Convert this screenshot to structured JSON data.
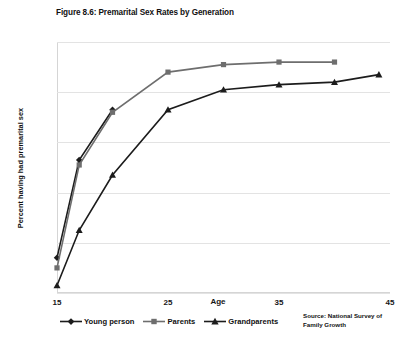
{
  "chart_data": {
    "type": "line",
    "title": "Figure 8.6: Premarital Sex Rates by Generation",
    "xlabel": "Age",
    "ylabel": "Percent having had premarital sex",
    "xlim": [
      15,
      45
    ],
    "ylim": [
      0,
      100
    ],
    "xticks": [
      "15",
      "25",
      "35",
      "45"
    ],
    "xtick_values": [
      15,
      25,
      35,
      45
    ],
    "yticks": [
      "0%",
      "20%",
      "40%",
      "60%",
      "80%",
      "100%"
    ],
    "ytick_values": [
      0,
      20,
      40,
      60,
      80,
      100
    ],
    "grid": "horizontal",
    "legend_position": "below-axis-left",
    "source": "Source: National Survey of Family Growth",
    "series": [
      {
        "name": "Young person",
        "marker": "diamond",
        "color": "#1c1c1c",
        "points": [
          {
            "x": 15,
            "y": 14
          },
          {
            "x": 17,
            "y": 53
          },
          {
            "x": 20,
            "y": 73
          }
        ]
      },
      {
        "name": "Parents",
        "marker": "square",
        "color": "#6e6e6e",
        "points": [
          {
            "x": 15,
            "y": 10
          },
          {
            "x": 17,
            "y": 51
          },
          {
            "x": 20,
            "y": 72
          },
          {
            "x": 25,
            "y": 88
          },
          {
            "x": 30,
            "y": 91
          },
          {
            "x": 35,
            "y": 92
          },
          {
            "x": 40,
            "y": 92
          }
        ]
      },
      {
        "name": "Grandparents",
        "marker": "triangle",
        "color": "#1c1c1c",
        "points": [
          {
            "x": 15,
            "y": 3
          },
          {
            "x": 17,
            "y": 25
          },
          {
            "x": 20,
            "y": 47
          },
          {
            "x": 25,
            "y": 73
          },
          {
            "x": 30,
            "y": 81
          },
          {
            "x": 35,
            "y": 83
          },
          {
            "x": 40,
            "y": 84
          },
          {
            "x": 44,
            "y": 87
          }
        ]
      }
    ]
  },
  "legend": {
    "items": [
      {
        "label": "Young person"
      },
      {
        "label": "Parents"
      },
      {
        "label": "Grandparents"
      }
    ]
  },
  "source_note": {
    "line1": "Source: National Survey of",
    "line2": "Family Growth"
  },
  "colors": {
    "series_dark": "#1c1c1c",
    "series_gray": "#6e6e6e",
    "gridline": "#e3e3e3",
    "axis": "#d5d5d5",
    "background": "#ffffff"
  }
}
